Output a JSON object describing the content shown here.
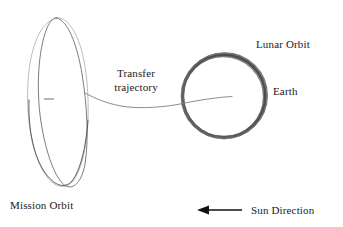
{
  "figure": {
    "background_color": "#ffffff",
    "ink_color": "#1a1a1a",
    "faint_ink_color": "#9a9a9a"
  },
  "labels": {
    "lunar_orbit": "Lunar Orbit",
    "earth": "Earth",
    "transfer_line1": "Transfer",
    "transfer_line2": "trajectory",
    "mission_orbit": "Mission Orbit",
    "sun_direction": "Sun Direction"
  },
  "diagram_data": {
    "type": "schematic",
    "elements": [
      {
        "name": "mission-orbit-ellipse-outer",
        "shape": "ellipse",
        "stroke": "#b0b0b0",
        "center": [
          58,
          103
        ],
        "rx": 30,
        "ry": 85,
        "rotation_deg": -8
      },
      {
        "name": "mission-orbit-ellipse-inner",
        "shape": "ellipse",
        "stroke": "#6e6e6e",
        "center": [
          63,
          101
        ],
        "rx": 25,
        "ry": 84,
        "rotation_deg": 4
      },
      {
        "name": "mission-orbit-center-tick",
        "shape": "line",
        "stroke": "#6e6e6e",
        "from": [
          44,
          99
        ],
        "to": [
          54,
          99
        ]
      },
      {
        "name": "lunar-orbit-ring",
        "shape": "circle",
        "stroke": "#4a4a4a",
        "stroke_width": 4,
        "center": [
          224,
          96
        ],
        "radius": 42
      },
      {
        "name": "transfer-trajectory-curve",
        "shape": "path",
        "stroke": "#7d7d7d",
        "from": [
          85,
          94
        ],
        "to": [
          232,
          97
        ],
        "note": "dips to y=107 near x=145 then rises into Earth center"
      },
      {
        "name": "sun-direction-arrow",
        "shape": "arrow",
        "stroke": "#111111",
        "from": [
          242,
          210
        ],
        "to": [
          198,
          210
        ],
        "direction": "left"
      }
    ]
  }
}
